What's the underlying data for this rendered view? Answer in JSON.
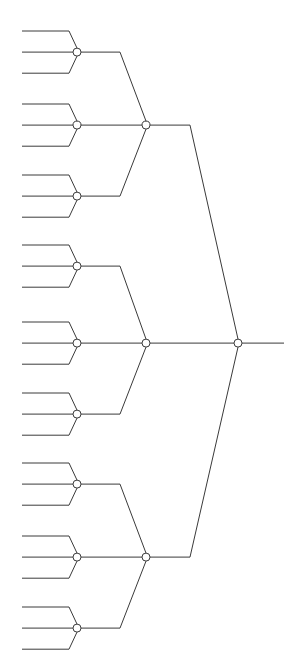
{
  "figure": {
    "name": "ternary-tree-diagram",
    "kind": "tree",
    "width": 293,
    "height": 665,
    "background_color": "#ffffff",
    "line_color": "#3a3a3a",
    "node_fill_color": "#ffffff",
    "node_stroke_color": "#3a3a3a",
    "line_width": 1,
    "node_radius": 4,
    "orientation": "left-to-right-leaves-to-root",
    "branching_factor": 3,
    "depth": 3,
    "leaf_count": 27,
    "internal_node_count": 13,
    "visible_text": ""
  },
  "geometry": {
    "leaf_tip_x": 22,
    "leaf_elbow_x": 69,
    "level1_node_x": 77,
    "level1_elbow_x": 120,
    "level2_node_x": 146,
    "level2_elbow_x": 190,
    "root_node_x": 238,
    "root_stem_end_x": 284,
    "leaf_spacing_y": 21.1,
    "first_leaf_y": 31,
    "root_node_y": 343
  },
  "chart_data": {
    "type": "tree",
    "title": "",
    "xlabel": "",
    "ylabel": "",
    "leaves": [
      {
        "id": "L1",
        "y": 31.0
      },
      {
        "id": "L2",
        "y": 52.1
      },
      {
        "id": "L3",
        "y": 73.2
      },
      {
        "id": "L4",
        "y": 104.0
      },
      {
        "id": "L5",
        "y": 125.1
      },
      {
        "id": "L6",
        "y": 146.2
      },
      {
        "id": "L7",
        "y": 175.0
      },
      {
        "id": "L8",
        "y": 196.1
      },
      {
        "id": "L9",
        "y": 217.2
      },
      {
        "id": "L10",
        "y": 245.0
      },
      {
        "id": "L11",
        "y": 266.1
      },
      {
        "id": "L12",
        "y": 287.2
      },
      {
        "id": "L13",
        "y": 322.0
      },
      {
        "id": "L14",
        "y": 343.1
      },
      {
        "id": "L15",
        "y": 364.2
      },
      {
        "id": "L16",
        "y": 393.0
      },
      {
        "id": "L17",
        "y": 414.1
      },
      {
        "id": "L18",
        "y": 435.2
      },
      {
        "id": "L19",
        "y": 463.0
      },
      {
        "id": "L20",
        "y": 484.1
      },
      {
        "id": "L21",
        "y": 505.2
      },
      {
        "id": "L22",
        "y": 536.0
      },
      {
        "id": "L23",
        "y": 557.1
      },
      {
        "id": "L24",
        "y": 578.2
      },
      {
        "id": "L25",
        "y": 607.0
      },
      {
        "id": "L26",
        "y": 628.1
      },
      {
        "id": "L27",
        "y": 649.2
      }
    ],
    "level1_nodes": [
      {
        "id": "N1",
        "x": 77,
        "y": 52.1,
        "children": [
          "L1",
          "L2",
          "L3"
        ]
      },
      {
        "id": "N2",
        "x": 77,
        "y": 125.1,
        "children": [
          "L4",
          "L5",
          "L6"
        ]
      },
      {
        "id": "N3",
        "x": 77,
        "y": 196.1,
        "children": [
          "L7",
          "L8",
          "L9"
        ]
      },
      {
        "id": "N4",
        "x": 77,
        "y": 266.1,
        "children": [
          "L10",
          "L11",
          "L12"
        ]
      },
      {
        "id": "N5",
        "x": 77,
        "y": 343.1,
        "children": [
          "L13",
          "L14",
          "L15"
        ]
      },
      {
        "id": "N6",
        "x": 77,
        "y": 414.1,
        "children": [
          "L16",
          "L17",
          "L18"
        ]
      },
      {
        "id": "N7",
        "x": 77,
        "y": 484.1,
        "children": [
          "L19",
          "L20",
          "L21"
        ]
      },
      {
        "id": "N8",
        "x": 77,
        "y": 557.1,
        "children": [
          "L22",
          "L23",
          "L24"
        ]
      },
      {
        "id": "N9",
        "x": 77,
        "y": 628.1,
        "children": [
          "L25",
          "L26",
          "L27"
        ]
      }
    ],
    "level2_nodes": [
      {
        "id": "M1",
        "x": 146,
        "y": 125.1,
        "children": [
          "N1",
          "N2",
          "N3"
        ]
      },
      {
        "id": "M2",
        "x": 146,
        "y": 343.1,
        "children": [
          "N4",
          "N5",
          "N6"
        ]
      },
      {
        "id": "M3",
        "x": 146,
        "y": 557.1,
        "children": [
          "N7",
          "N8",
          "N9"
        ]
      }
    ],
    "root_node": {
      "id": "R",
      "x": 238,
      "y": 343.1,
      "children": [
        "M1",
        "M2",
        "M3"
      ]
    },
    "legend": [],
    "annotations": []
  }
}
